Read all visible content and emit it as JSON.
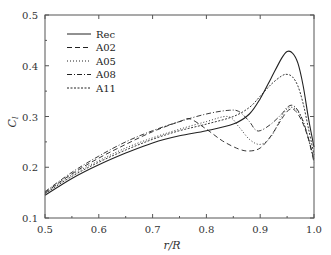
{
  "chart_data": {
    "type": "line",
    "title": "",
    "xlabel": "r/R",
    "ylabel": "C_l",
    "xlim": [
      0.5,
      1.0
    ],
    "ylim": [
      0.1,
      0.5
    ],
    "xticks": [
      "0.5",
      "0.6",
      "0.7",
      "0.8",
      "0.9",
      "1.0"
    ],
    "yticks": [
      "0.1",
      "0.2",
      "0.3",
      "0.4",
      "0.5"
    ],
    "grid": false,
    "legend_position": "upper left",
    "series": [
      {
        "name": "Rec",
        "style": "solid",
        "x": [
          0.5,
          0.55,
          0.6,
          0.65,
          0.7,
          0.75,
          0.8,
          0.85,
          0.88,
          0.9,
          0.92,
          0.94,
          0.95,
          0.96,
          0.97,
          0.98,
          0.99,
          1.0
        ],
        "y": [
          0.145,
          0.178,
          0.205,
          0.228,
          0.248,
          0.262,
          0.272,
          0.285,
          0.305,
          0.335,
          0.375,
          0.415,
          0.428,
          0.425,
          0.405,
          0.36,
          0.295,
          0.24
        ]
      },
      {
        "name": "A02",
        "style": "dashed",
        "x": [
          0.5,
          0.55,
          0.6,
          0.65,
          0.7,
          0.75,
          0.77,
          0.8,
          0.83,
          0.86,
          0.88,
          0.9,
          0.92,
          0.94,
          0.95,
          0.96,
          0.97,
          0.98,
          0.99,
          1.0
        ],
        "y": [
          0.15,
          0.187,
          0.218,
          0.245,
          0.27,
          0.29,
          0.295,
          0.275,
          0.252,
          0.236,
          0.232,
          0.238,
          0.262,
          0.295,
          0.31,
          0.315,
          0.305,
          0.285,
          0.255,
          0.215
        ]
      },
      {
        "name": "A05",
        "style": "dotted",
        "x": [
          0.5,
          0.55,
          0.6,
          0.65,
          0.7,
          0.75,
          0.8,
          0.84,
          0.86,
          0.88,
          0.9,
          0.92,
          0.94,
          0.95,
          0.96,
          0.97,
          0.98,
          0.99,
          1.0
        ],
        "y": [
          0.15,
          0.185,
          0.213,
          0.238,
          0.258,
          0.275,
          0.29,
          0.3,
          0.28,
          0.255,
          0.245,
          0.26,
          0.3,
          0.315,
          0.318,
          0.31,
          0.29,
          0.255,
          0.215
        ]
      },
      {
        "name": "A08",
        "style": "dash-dot",
        "x": [
          0.5,
          0.55,
          0.6,
          0.65,
          0.7,
          0.75,
          0.8,
          0.84,
          0.86,
          0.88,
          0.89,
          0.9,
          0.92,
          0.94,
          0.95,
          0.96,
          0.97,
          0.98,
          0.99,
          1.0
        ],
        "y": [
          0.152,
          0.19,
          0.222,
          0.25,
          0.272,
          0.29,
          0.305,
          0.312,
          0.31,
          0.29,
          0.275,
          0.272,
          0.285,
          0.305,
          0.318,
          0.322,
          0.312,
          0.29,
          0.255,
          0.21
        ]
      },
      {
        "name": "A11",
        "style": "short-dashed",
        "x": [
          0.5,
          0.55,
          0.6,
          0.65,
          0.7,
          0.75,
          0.8,
          0.85,
          0.88,
          0.9,
          0.92,
          0.94,
          0.95,
          0.96,
          0.97,
          0.98,
          0.99,
          1.0
        ],
        "y": [
          0.148,
          0.182,
          0.21,
          0.234,
          0.255,
          0.272,
          0.285,
          0.3,
          0.318,
          0.34,
          0.363,
          0.38,
          0.383,
          0.378,
          0.36,
          0.325,
          0.275,
          0.225
        ]
      }
    ]
  }
}
